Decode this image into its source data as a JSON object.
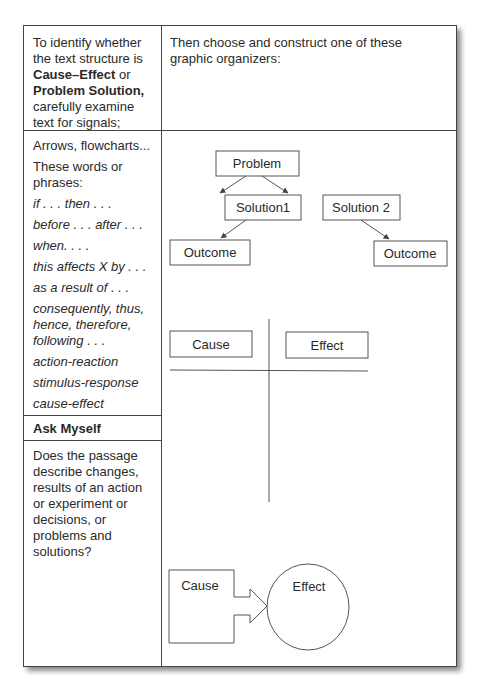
{
  "header": {
    "left": {
      "prefix": "To identify whether the text structure is ",
      "bold1": "Cause–Effect",
      "mid": " or ",
      "bold2": "Problem Solution,",
      "suffix": " carefully examine text for signals;"
    },
    "right": "Then choose and construct one of these graphic organizers:"
  },
  "signals": {
    "items": [
      {
        "text": "Arrows, flowcharts...",
        "italic": false
      },
      {
        "text": "These words or phrases:",
        "italic": false
      },
      {
        "text": "if . . . then . . .",
        "italic": true
      },
      {
        "text": "before . . . after . . .",
        "italic": true
      },
      {
        "text": "when. . . .",
        "italic": true
      },
      {
        "text": "this affects X by . . .",
        "italic": true
      },
      {
        "text": "as a result of . . .",
        "italic": true
      },
      {
        "text": "consequently, thus, hence, therefore, following . . .",
        "italic": true
      },
      {
        "text": "action-reaction",
        "italic": true
      },
      {
        "text": "stimulus-response",
        "italic": true
      },
      {
        "text": "cause-effect",
        "italic": true
      }
    ]
  },
  "ask": {
    "title": "Ask Myself",
    "body": "Does the passage describe changes, results of an action or experiment or decisions, or problems and solutions?"
  },
  "diagrams": {
    "problem_solution": {
      "problem": "Problem",
      "solution1": "Solution1",
      "solution2": "Solution 2",
      "outcome1": "Outcome",
      "outcome2": "Outcome"
    },
    "t_chart": {
      "cause": "Cause",
      "effect": "Effect"
    },
    "arrow_circle": {
      "cause": "Cause",
      "effect": "Effect"
    }
  }
}
